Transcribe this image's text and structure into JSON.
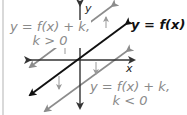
{
  "figure": {
    "labels": {
      "upper_line": {
        "line1": "y = f(x) + k,",
        "line2": "k > 0"
      },
      "main_line": "y = f(x)",
      "lower_line": {
        "line1": "y = f(x) + k,",
        "line2": "k < 0"
      },
      "y_axis": "y",
      "x_axis": "x"
    },
    "colors": {
      "main_line": "#111111",
      "shifted_lines": "#8c8c8c",
      "axes": "#333333",
      "shift_arrows": "#999999",
      "frame_rule": "#d9d9d9"
    }
  }
}
